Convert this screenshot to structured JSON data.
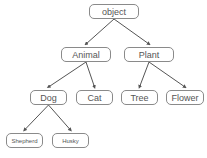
{
  "diagram": {
    "type": "tree",
    "colors": {
      "border": "#8a8a8a",
      "text": "#555555",
      "edge": "#555555",
      "background": "#ffffff"
    },
    "nodes": {
      "object": {
        "label": "object",
        "x": 89,
        "y": 4,
        "w": 50,
        "h": 15
      },
      "animal": {
        "label": "Animal",
        "x": 61,
        "y": 47,
        "w": 50,
        "h": 15
      },
      "plant": {
        "label": "Plant",
        "x": 124,
        "y": 47,
        "w": 50,
        "h": 15
      },
      "dog": {
        "label": "Dog",
        "x": 30,
        "y": 90,
        "w": 37,
        "h": 15
      },
      "cat": {
        "label": "Cat",
        "x": 76,
        "y": 90,
        "w": 37,
        "h": 15
      },
      "tree": {
        "label": "Tree",
        "x": 121,
        "y": 90,
        "w": 37,
        "h": 15
      },
      "flower": {
        "label": "Flower",
        "x": 166,
        "y": 90,
        "w": 38,
        "h": 15
      },
      "shepherd": {
        "label": "Shepherd",
        "x": 6,
        "y": 133,
        "w": 37,
        "h": 15
      },
      "husky": {
        "label": "Husky",
        "x": 52,
        "y": 133,
        "w": 37,
        "h": 15
      }
    },
    "edges": [
      {
        "from": "object",
        "to": "animal"
      },
      {
        "from": "object",
        "to": "plant"
      },
      {
        "from": "animal",
        "to": "dog"
      },
      {
        "from": "animal",
        "to": "cat"
      },
      {
        "from": "plant",
        "to": "tree"
      },
      {
        "from": "plant",
        "to": "flower"
      },
      {
        "from": "dog",
        "to": "shepherd"
      },
      {
        "from": "dog",
        "to": "husky"
      }
    ]
  }
}
